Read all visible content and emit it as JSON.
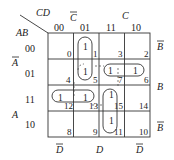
{
  "diagram": {
    "type": "karnaugh-map",
    "corner": {
      "row_var": "AB",
      "col_var": "CD"
    },
    "column_codes": [
      "00",
      "01",
      "11",
      "10"
    ],
    "row_codes": [
      "00",
      "01",
      "11",
      "10"
    ],
    "top_group_labels": [
      {
        "text": "C",
        "bar": true,
        "span": "cols 00-01"
      },
      {
        "text": "C",
        "bar": false,
        "span": "cols 11-10"
      }
    ],
    "left_group_labels": [
      {
        "text": "A",
        "bar": true,
        "span": "rows 00-01"
      },
      {
        "text": "A",
        "bar": false,
        "span": "rows 11-10"
      }
    ],
    "right_group_labels": [
      {
        "text": "B",
        "bar": true,
        "row": "00"
      },
      {
        "text": "B",
        "bar": false,
        "span": "rows 01-11"
      },
      {
        "text": "B",
        "bar": true,
        "row": "10"
      }
    ],
    "bottom_group_labels": [
      {
        "text": "D",
        "bar": true,
        "col": "00"
      },
      {
        "text": "D",
        "bar": false,
        "span": "cols 01-11"
      },
      {
        "text": "D",
        "bar": true,
        "col": "10"
      }
    ],
    "cells": [
      [
        {
          "index": "0",
          "value": ""
        },
        {
          "index": "1",
          "value": "1"
        },
        {
          "index": "3",
          "value": ""
        },
        {
          "index": "2",
          "value": ""
        }
      ],
      [
        {
          "index": "4",
          "value": ""
        },
        {
          "index": "5",
          "value": "1"
        },
        {
          "index": "7",
          "value": "1"
        },
        {
          "index": "6",
          "value": "1"
        }
      ],
      [
        {
          "index": "12",
          "value": "1"
        },
        {
          "index": "13",
          "value": "1"
        },
        {
          "index": "15",
          "value": "1"
        },
        {
          "index": "14",
          "value": ""
        }
      ],
      [
        {
          "index": "8",
          "value": ""
        },
        {
          "index": "9",
          "value": ""
        },
        {
          "index": "11",
          "value": "1"
        },
        {
          "index": "10",
          "value": ""
        }
      ]
    ],
    "groups": [
      {
        "cells": [
          "1",
          "5"
        ],
        "style": "solid"
      },
      {
        "cells": [
          "7",
          "6"
        ],
        "style": "solid"
      },
      {
        "cells": [
          "12",
          "13"
        ],
        "style": "solid"
      },
      {
        "cells": [
          "15",
          "11"
        ],
        "style": "solid"
      },
      {
        "cells": [
          "5",
          "7",
          "13",
          "15"
        ],
        "style": "dashed"
      }
    ]
  }
}
